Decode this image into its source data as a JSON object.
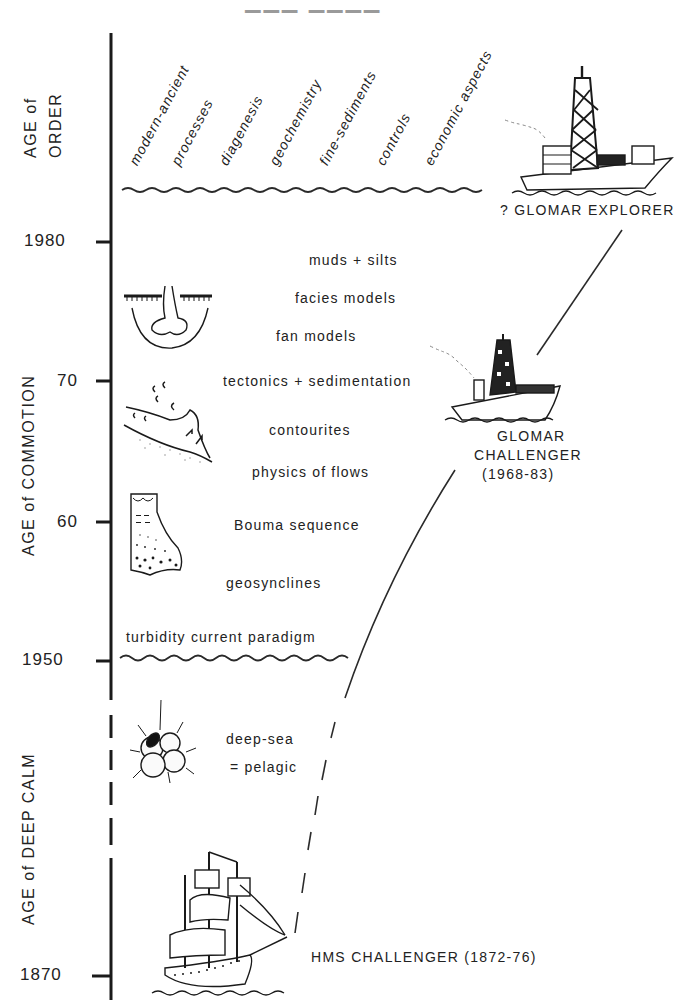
{
  "title_fragment": "",
  "timeline": {
    "ticks": [
      {
        "label": "1980"
      },
      {
        "label": "70"
      },
      {
        "label": "60"
      },
      {
        "label": "1950"
      },
      {
        "label": "1870"
      }
    ],
    "ages": [
      {
        "line1": "AGE of",
        "line2": "ORDER"
      },
      {
        "label": "AGE of COMMOTION"
      },
      {
        "label": "AGE of DEEP CALM"
      }
    ]
  },
  "order_topics": [
    "modern-ancient",
    "processes",
    "diagenesis",
    "geochemistry",
    "fine-sediments",
    "controls",
    "economic aspects"
  ],
  "commotion_topics": [
    "muds + silts",
    "facies models",
    "fan models",
    "tectonics + sedimentation",
    "contourites",
    "physics of flows",
    "Bouma sequence",
    "geosynclines",
    "turbidity current paradigm"
  ],
  "deep_calm_topics": [
    "deep-sea",
    "= pelagic"
  ],
  "ships": [
    {
      "name": "? GLOMAR EXPLORER"
    },
    {
      "line1": "GLOMAR",
      "line2": "CHALLENGER",
      "line3": "(1968-83)"
    },
    {
      "name": "HMS CHALLENGER (1872-76)"
    }
  ],
  "icons": [
    "submarine-fan-icon",
    "contourite-current-icon",
    "bouma-sequence-core-icon",
    "foraminifera-icon",
    "sailing-ship-icon",
    "drill-ship-icon"
  ],
  "colors": {
    "ink": "#1e1e1e",
    "background": "#ffffff"
  }
}
